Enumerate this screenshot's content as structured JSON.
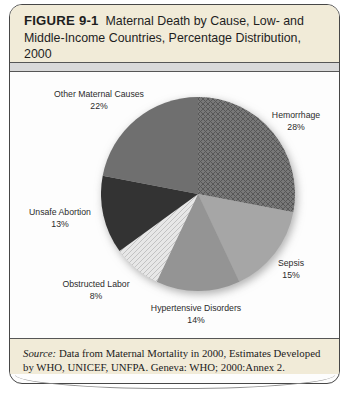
{
  "figure": {
    "label": "FIGURE 9-1",
    "title": "Maternal Death by Cause, Low- and Middle-Income Countries, Percentage Distribution, 2000",
    "source_prefix": "Source:",
    "source_text": " Data from Maternal Mortality in 2000, Estimates Developed by WHO, UNICEF, UNFPA. Geneva: WHO; 2000:Annex 2."
  },
  "colors": {
    "panel_bg": "#f1ebd8",
    "strip_bg": "#d9d9d9",
    "chart_bg": "#fdfdfd",
    "border": "#474747"
  },
  "chart_data": {
    "type": "pie",
    "title": "Maternal Death by Cause, Low- and Middle-Income Countries, Percentage Distribution, 2000",
    "start": "top",
    "direction": "clockwise",
    "unit": "%",
    "slices": [
      {
        "label": "Hemorrhage",
        "value": 28,
        "color": "#787878",
        "pattern": "crosshatch",
        "pattern_color": "#575757"
      },
      {
        "label": "Sepsis",
        "value": 15,
        "color": "#a6a6a6",
        "pattern": "solid"
      },
      {
        "label": "Hypertensive Disorders",
        "value": 14,
        "color": "#949494",
        "pattern": "solid"
      },
      {
        "label": "Obstructed Labor",
        "value": 8,
        "color": "#e7e7e7",
        "pattern": "diagonal",
        "pattern_color": "#c2c2c2"
      },
      {
        "label": "Unsafe Abortion",
        "value": 13,
        "color": "#333333",
        "pattern": "solid"
      },
      {
        "label": "Other Maternal Causes",
        "value": 22,
        "color": "#6f6f6f",
        "pattern": "solid"
      }
    ]
  }
}
